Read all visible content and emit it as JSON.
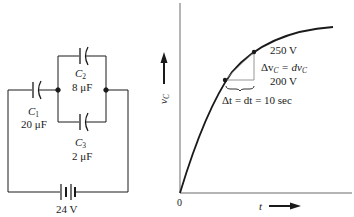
{
  "circuit": {
    "capacitors": [
      {
        "name": "C",
        "sub": "1",
        "value": "20 μF"
      },
      {
        "name": "C",
        "sub": "2",
        "value": "8 μF"
      },
      {
        "name": "C",
        "sub": "3",
        "value": "2 μF"
      }
    ],
    "battery": {
      "value": "24 V"
    }
  },
  "graph": {
    "y_axis_label": "v",
    "y_axis_label_sub": "C",
    "x_axis_label": "t",
    "origin_label": "0",
    "upper_point_label": "250 V",
    "lower_point_label": "200 V",
    "delta_v_label": {
      "lhs": "Δv",
      "lhs_sub": "C",
      "eq": " = dv",
      "rhs_sub": "C"
    },
    "delta_t_label": "Δt = dt = 10 sec"
  },
  "colors": {
    "ink": "#1a1a1a",
    "grey_line": "#8a8a8a",
    "background": "#ffffff"
  }
}
